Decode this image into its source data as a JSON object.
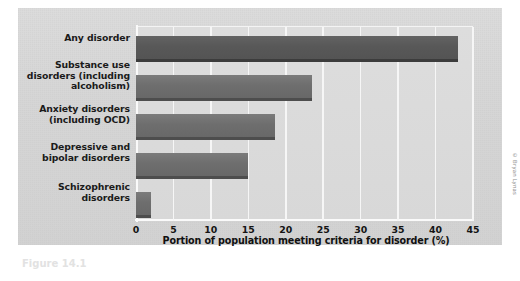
{
  "figure": {
    "credit": "© Bryan Lynas",
    "caption_remnant": "Figure 14.1"
  },
  "chart_data": {
    "type": "bar",
    "orientation": "horizontal",
    "title": "",
    "xlabel": "Portion of population meeting criteria for disorder (%)",
    "ylabel": "",
    "xlim": [
      0,
      45
    ],
    "xticks": [
      0,
      5,
      10,
      15,
      20,
      25,
      30,
      35,
      40,
      45
    ],
    "xtick_labels": [
      "0",
      "5",
      "10",
      "15",
      "20",
      "25",
      "30",
      "35",
      "40",
      "45"
    ],
    "grid": "vertical",
    "legend": "none",
    "categories": [
      "Any disorder",
      "Substance use disorders (including alcoholism)",
      "Anxiety disorders (including OCD)",
      "Depressive and bipolar disorders",
      "Schizophrenic disorders"
    ],
    "category_lines": [
      [
        "Any disorder"
      ],
      [
        "Substance use",
        "disorders (including",
        "alcoholism)"
      ],
      [
        "Anxiety disorders",
        "(including OCD)"
      ],
      [
        "Depressive and",
        "bipolar disorders"
      ],
      [
        "Schizophrenic",
        "disorders"
      ]
    ],
    "values": [
      43.0,
      23.5,
      18.6,
      15.0,
      2.0
    ],
    "bar_color": "#6e6e6e",
    "bar_shadow_color": "#4d4d4d",
    "gridline_color": "#f6f6f6",
    "plot_background": "#d8d8d8",
    "panel_background": "#d6d6d6"
  }
}
